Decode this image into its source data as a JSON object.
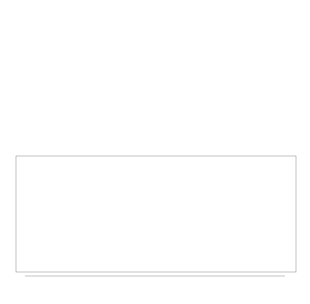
{
  "figure": {
    "panels": [
      {
        "id": "graph-sparse",
        "type": "network",
        "center": [
          80,
          76
        ],
        "radius": 57,
        "nodes": 110,
        "edge_density": "sparse"
      },
      {
        "id": "graph-dense",
        "type": "network",
        "center": [
          232,
          72
        ],
        "radius": 60,
        "nodes": 130,
        "edge_density": "dense"
      }
    ]
  },
  "chart_data": {
    "type": "barcode",
    "title": "",
    "xlabel": "r",
    "ylabel": "",
    "xlim": [
      0.0,
      0.3
    ],
    "x_ticks": [
      "0.00",
      "0.05",
      "0.10",
      "0.15",
      "0.20",
      "0.25",
      "0.30"
    ],
    "dimension0_bars_death": [
      0.008,
      0.017,
      0.025,
      0.031,
      0.036,
      0.04,
      0.045,
      0.049,
      0.053,
      0.056,
      0.059,
      0.063,
      0.066,
      0.069,
      0.072,
      0.075,
      0.077,
      0.08,
      0.083,
      0.086,
      0.089,
      0.091,
      0.094,
      0.096,
      0.099,
      0.102,
      0.105,
      0.107,
      0.11,
      0.113,
      0.116,
      0.119,
      0.122,
      0.126,
      0.13,
      0.134,
      0.138,
      0.142,
      0.146,
      0.15,
      0.155,
      0.16,
      0.166,
      0.172,
      0.178,
      0.184,
      0.192,
      0.2,
      0.207,
      0.214,
      0.222,
      0.23,
      0.3
    ],
    "dimension0_birth": 0.0,
    "dimension1_bars": [
      {
        "birth": 0.147,
        "death": 0.15
      },
      {
        "birth": 0.165,
        "death": 0.222
      },
      {
        "birth": 0.19,
        "death": 0.196
      },
      {
        "birth": 0.2,
        "death": 0.202
      },
      {
        "birth": 0.23,
        "death": 0.3
      }
    ],
    "grid": false,
    "legend": null
  }
}
